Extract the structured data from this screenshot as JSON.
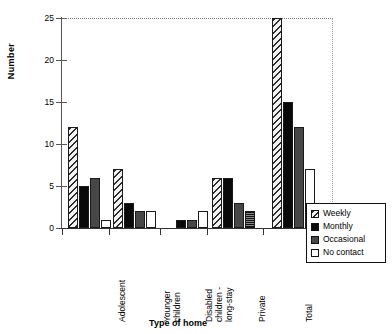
{
  "chart_data": {
    "type": "bar",
    "title": "",
    "xlabel": "Type of home",
    "ylabel": "Number",
    "ylim": [
      0,
      25
    ],
    "yticks": [
      0,
      5,
      10,
      15,
      20,
      25
    ],
    "grid": false,
    "legend_position": "right-bottom",
    "categories": [
      "Adolescent",
      "Younger children",
      "Disabled children - long-stay",
      "Private",
      "Total"
    ],
    "category_lines": [
      [
        "Adolescent"
      ],
      [
        "Younger",
        "children"
      ],
      [
        "Disabled",
        "children -",
        "long-stay"
      ],
      [
        "Private"
      ],
      [
        "Total"
      ]
    ],
    "series": [
      {
        "name": "Weekly",
        "pattern": "hatched-diagonal",
        "values": [
          12,
          7,
          0,
          6,
          25
        ]
      },
      {
        "name": "Monthly",
        "pattern": "solid-black",
        "values": [
          5,
          3,
          1,
          6,
          15
        ]
      },
      {
        "name": "Occasional",
        "pattern": "solid-dark-gray",
        "values": [
          6,
          2,
          1,
          3,
          12
        ]
      },
      {
        "name": "No contact",
        "pattern": "white",
        "values": [
          1,
          2,
          2,
          2,
          7
        ]
      }
    ]
  },
  "axis": {
    "y_title": "Number",
    "x_title": "Type of home",
    "y_tick_labels": [
      "0",
      "5",
      "10",
      "15",
      "20",
      "25"
    ]
  },
  "legend": {
    "entries": [
      {
        "label": "Weekly",
        "swatch": "hatched-diagonal"
      },
      {
        "label": "Monthly",
        "swatch": "solid-black"
      },
      {
        "label": "Occasional",
        "swatch": "solid-dark-gray"
      },
      {
        "label": "No contact",
        "swatch": "white"
      }
    ]
  },
  "colors": {
    "axis": "#333333",
    "bar_outline": "#1a1a1a",
    "monthly": "#0a0a0a",
    "occasional": "#474747",
    "no_contact": "#ffffff",
    "weekly_hatch": "#2b2b2b",
    "background": "#ffffff"
  }
}
